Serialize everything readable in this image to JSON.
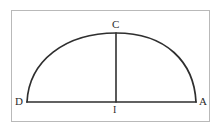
{
  "figure": {
    "kind": "geometry-diagram",
    "background_color": "#ffffff",
    "frame": {
      "name": "diagram-border",
      "color": "#b9b9b9",
      "x": 11,
      "y": 10,
      "width": 199,
      "height": 112
    },
    "stroke": {
      "color": "#2f2f2f",
      "width": 1.6,
      "style": "hand-drawn"
    },
    "points": [
      {
        "id": "C",
        "label": "C",
        "x": 116,
        "y": 33,
        "role": "apex-of-arc",
        "label_x": 112,
        "label_y": 19
      },
      {
        "id": "D",
        "label": "D",
        "x": 27,
        "y": 102,
        "role": "left-endpoint",
        "label_x": 15,
        "label_y": 96
      },
      {
        "id": "A",
        "label": "A",
        "x": 196,
        "y": 102,
        "role": "right-endpoint",
        "label_x": 199,
        "label_y": 96
      },
      {
        "id": "I",
        "label": "I",
        "x": 116,
        "y": 102,
        "role": "midpoint-of-base",
        "label_x": 113,
        "label_y": 104
      }
    ],
    "segments": [
      {
        "id": "DA",
        "from": "D",
        "to": "A",
        "label": "diameter"
      },
      {
        "id": "CI",
        "from": "C",
        "to": "I",
        "label": "radius"
      }
    ],
    "arcs": [
      {
        "id": "DCA",
        "from": "D",
        "through": "C",
        "to": "A",
        "label": "semicircle"
      }
    ]
  }
}
